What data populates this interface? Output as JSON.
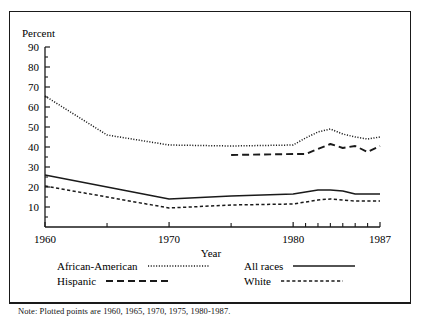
{
  "chart_data": {
    "type": "line",
    "title": "",
    "xlabel": "Year",
    "ylabel": "Percent",
    "xlim": [
      1960,
      1987
    ],
    "ylim": [
      0,
      90
    ],
    "ytick_labels": [
      "90",
      "80",
      "70",
      "60",
      "50",
      "40",
      "30",
      "20",
      "10"
    ],
    "ytick_values": [
      90,
      80,
      70,
      60,
      50,
      40,
      30,
      20,
      10
    ],
    "yminor_step": 5,
    "xtick_labels": [
      "1960",
      "1970",
      "1980",
      "1987"
    ],
    "xtick_values": [
      1960,
      1970,
      1980,
      1987
    ],
    "xminor_values": [
      1965,
      1975,
      1981,
      1982,
      1983,
      1984,
      1985,
      1986
    ],
    "grid": false,
    "legend_position": "below-axes",
    "note": "Note: Plotted points are 1960, 1965, 1970, 1975, 1980-1987.",
    "series": [
      {
        "name": "African-American",
        "style": "dotted",
        "x": [
          1960,
          1965,
          1970,
          1975,
          1980,
          1981,
          1982,
          1983,
          1984,
          1985,
          1986,
          1987
        ],
        "values": [
          65.5,
          46.0,
          41.0,
          40.5,
          41.0,
          44.5,
          47.5,
          49.0,
          46.5,
          45.0,
          44.0,
          45.0
        ]
      },
      {
        "name": "All races",
        "style": "solid",
        "x": [
          1960,
          1965,
          1970,
          1975,
          1980,
          1981,
          1982,
          1983,
          1984,
          1985,
          1986,
          1987
        ],
        "values": [
          26.0,
          20.0,
          14.0,
          15.5,
          16.5,
          17.5,
          18.5,
          18.5,
          18.0,
          16.5,
          16.5,
          16.5
        ]
      },
      {
        "name": "Hispanic",
        "style": "long-dash",
        "x": [
          1975,
          1980,
          1981,
          1982,
          1983,
          1984,
          1985,
          1986,
          1987
        ],
        "values": [
          36.0,
          36.5,
          36.5,
          39.0,
          41.5,
          39.5,
          40.5,
          37.5,
          40.5
        ]
      },
      {
        "name": "White",
        "style": "short-dash",
        "x": [
          1960,
          1965,
          1970,
          1975,
          1980,
          1981,
          1982,
          1983,
          1984,
          1985,
          1986,
          1987
        ],
        "values": [
          20.5,
          15.0,
          9.5,
          11.0,
          11.5,
          12.5,
          13.5,
          14.0,
          13.5,
          13.0,
          13.0,
          13.0
        ]
      }
    ]
  },
  "axes": {
    "ylabel": "Percent",
    "xlabel": "Year"
  },
  "legend": {
    "rows": [
      {
        "left": {
          "label": "African-American",
          "style": "dotted"
        },
        "right": {
          "label": "All races",
          "style": "solid"
        }
      },
      {
        "left": {
          "label": "Hispanic",
          "style": "long-dash"
        },
        "right": {
          "label": "White",
          "style": "short-dash"
        }
      }
    ]
  },
  "footer": {
    "note": "Note: Plotted points are 1960, 1965, 1970, 1975, 1980-1987."
  }
}
